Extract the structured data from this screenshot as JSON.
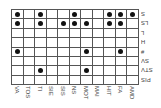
{
  "chart_data": {
    "type": "table",
    "title": "",
    "columns": [
      "VA",
      "TOS",
      "TI",
      "SIE",
      "SIS",
      "NS",
      "MOT",
      "MAI",
      "HIT",
      "FA",
      "AMD"
    ],
    "rows": [
      "S",
      "LS",
      "L",
      "H",
      "#",
      "SV",
      "STV",
      "PIS"
    ],
    "cells": [
      [
        1,
        0,
        1,
        0,
        0,
        1,
        0,
        0,
        1,
        1,
        1
      ],
      [
        1,
        0,
        1,
        0,
        1,
        1,
        1,
        0,
        1,
        1,
        0
      ],
      [
        0,
        0,
        0,
        0,
        0,
        0,
        0,
        0,
        0,
        0,
        0
      ],
      [
        0,
        0,
        0,
        0,
        0,
        0,
        0,
        0,
        0,
        0,
        0
      ],
      [
        1,
        0,
        0,
        0,
        0,
        0,
        1,
        0,
        0,
        1,
        0
      ],
      [
        0,
        0,
        0,
        0,
        0,
        0,
        0,
        0,
        0,
        0,
        0
      ],
      [
        0,
        0,
        1,
        0,
        0,
        0,
        1,
        0,
        0,
        0,
        0
      ],
      [
        0,
        0,
        0,
        0,
        0,
        0,
        0,
        0,
        0,
        0,
        0
      ]
    ],
    "marker": "filled-dot",
    "grid": true
  },
  "colors": {
    "dot": "#111111",
    "grid": "#555555",
    "label": "#444444"
  }
}
